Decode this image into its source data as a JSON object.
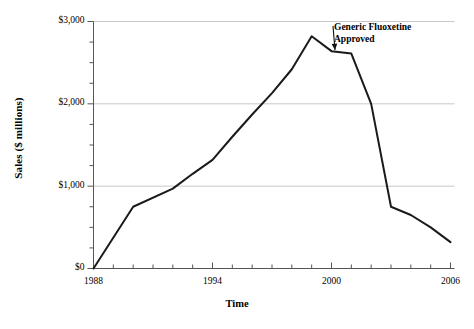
{
  "chart_data": {
    "type": "line",
    "title": "",
    "xlabel": "Time",
    "ylabel": "Sales ($ millions)",
    "xlim": [
      1988,
      2006
    ],
    "ylim": [
      0,
      3000
    ],
    "xticks": [
      1988,
      1994,
      2000,
      2006
    ],
    "xtick_labels": [
      "1988",
      "1994",
      "2000",
      "2006"
    ],
    "xtick_minor_step": 1,
    "yticks": [
      0,
      1000,
      2000,
      3000
    ],
    "ytick_labels": [
      "$0",
      "$1,000",
      "$2,000",
      "$3,000"
    ],
    "ytick_minor_step": 250,
    "grid": "horizontal-major",
    "grid_color": "#c8c8c8",
    "line_color": "#1a1a1a",
    "line_width": 2,
    "background": "#ffffff",
    "legend": "none",
    "x": [
      1988,
      1990,
      1992,
      1993,
      1994,
      1995,
      1996,
      1997,
      1998,
      1999,
      2000,
      2001,
      2002,
      2003,
      2004,
      2005,
      2006
    ],
    "values": [
      0,
      750,
      970,
      1150,
      1320,
      1600,
      1870,
      2130,
      2420,
      2820,
      2640,
      2610,
      2000,
      750,
      650,
      500,
      320
    ],
    "series": [
      {
        "name": "Sales",
        "values": [
          0,
          750,
          970,
          1150,
          1320,
          1600,
          1870,
          2130,
          2420,
          2820,
          2640,
          2610,
          2000,
          750,
          650,
          500,
          320
        ]
      }
    ],
    "annotations": [
      {
        "text_line1": "Generic Fluoxetine",
        "text_line2": "Approved",
        "points_to_x": 2000,
        "points_to_y": 2610,
        "arrow": true
      }
    ]
  },
  "axes": {
    "y_title": "Sales ($ millions)",
    "x_title": "Time"
  },
  "annotation": {
    "line1": "Generic Fluoxetine",
    "line2": "Approved"
  }
}
